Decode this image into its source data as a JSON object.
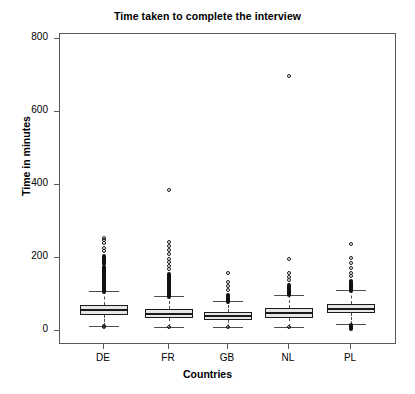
{
  "chart_data": {
    "type": "box",
    "title": "Time taken to complete the interview",
    "xlabel": "Countries",
    "ylabel": "Time in minutes",
    "categories": [
      "DE",
      "FR",
      "GB",
      "NL",
      "PL"
    ],
    "ylim": [
      0,
      860
    ],
    "yticks": [
      0,
      200,
      400,
      600,
      800
    ],
    "ytick_labels": [
      "0",
      "200",
      "400",
      "600",
      "800"
    ],
    "grid": false,
    "legend": null,
    "series": [
      {
        "name": "DE",
        "q1": 45,
        "median": 58,
        "q3": 72,
        "whisker_low": 14,
        "whisker_high": 110,
        "outliers_low": [
          14,
          12
        ],
        "outliers_high": [
          112,
          115,
          118,
          120,
          123,
          126,
          129,
          132,
          135,
          138,
          141,
          145,
          149,
          153,
          158,
          163,
          168,
          175,
          182,
          190,
          196,
          203,
          210,
          218,
          228,
          240,
          248,
          255
        ]
      },
      {
        "name": "FR",
        "q1": 35,
        "median": 46,
        "q3": 60,
        "whisker_low": 12,
        "whisker_high": 95,
        "outliers_low": [
          12
        ],
        "outliers_high": [
          98,
          101,
          104,
          107,
          110,
          114,
          118,
          122,
          126,
          131,
          136,
          142,
          148,
          155,
          162,
          170,
          178,
          188,
          198,
          210,
          222,
          232,
          243,
          385
        ]
      },
      {
        "name": "GB",
        "q1": 30,
        "median": 40,
        "q3": 52,
        "whisker_low": 10,
        "whisker_high": 82,
        "outliers_low": [
          10
        ],
        "outliers_high": [
          85,
          89,
          93,
          98,
          104,
          112,
          122,
          135,
          160
        ]
      },
      {
        "name": "NL",
        "q1": 36,
        "median": 48,
        "q3": 62,
        "whisker_low": 12,
        "whisker_high": 100,
        "outliers_low": [
          12
        ],
        "outliers_high": [
          103,
          107,
          112,
          118,
          124,
          131,
          139,
          148,
          158,
          196,
          698
        ]
      },
      {
        "name": "PL",
        "q1": 48,
        "median": 60,
        "q3": 74,
        "whisker_low": 20,
        "whisker_high": 112,
        "outliers_low": [
          22,
          18,
          14,
          11
        ],
        "outliers_high": [
          115,
          119,
          124,
          129,
          135,
          142,
          150,
          160,
          172,
          186,
          200,
          238
        ]
      }
    ]
  }
}
